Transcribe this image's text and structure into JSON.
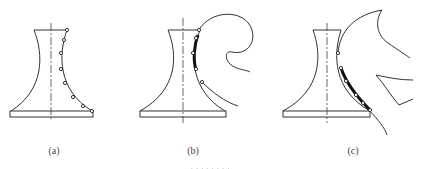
{
  "figure": {
    "panels": [
      {
        "id": "a",
        "label": "(a)",
        "description": "Flared profile with contact points along right contour"
      },
      {
        "id": "b",
        "label": "(b)",
        "description": "Upper section of contour wrapped with curled strip"
      },
      {
        "id": "c",
        "label": "(c)",
        "description": "Lower section of contour wrapped with spreading strips"
      }
    ],
    "caption": "· · · · · · · ·"
  }
}
